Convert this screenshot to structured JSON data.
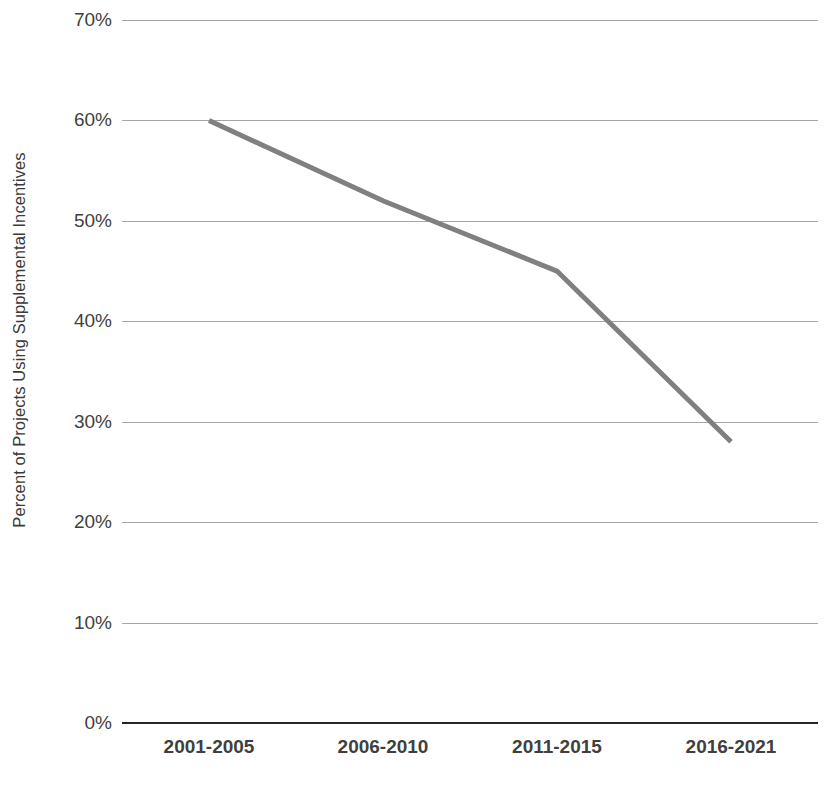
{
  "chart_data": {
    "type": "line",
    "title": "",
    "xlabel": "",
    "ylabel": "Percent of Projects Using Supplemental Incentives",
    "categories": [
      "2001-2005",
      "2006-2010",
      "2011-2015",
      "2016-2021"
    ],
    "values": [
      60,
      52,
      45,
      28
    ],
    "series": [
      {
        "name": "Percent of Projects Using Supplemental Incentives",
        "values": [
          60,
          52,
          45,
          28
        ],
        "color": "#808080"
      }
    ],
    "ylim": [
      0,
      70
    ],
    "ytick_values": [
      0,
      10,
      20,
      30,
      40,
      50,
      60,
      70
    ],
    "ytick_labels": [
      "0%",
      "10%",
      "20%",
      "30%",
      "40%",
      "50%",
      "60%",
      "70%"
    ],
    "grid": true,
    "grid_axis": "y",
    "grid_color": "#a6a6a6",
    "axis_color": "#262626",
    "legend": false,
    "legend_position": "none",
    "markers": false,
    "line_width": 5,
    "background": "#ffffff"
  }
}
